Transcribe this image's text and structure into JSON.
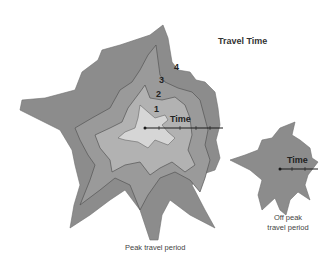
{
  "title": "Travel Time",
  "peak": {
    "caption": "Peak travel period",
    "contours": [
      {
        "label": "4",
        "fill": "#8c8c8c"
      },
      {
        "label": "3",
        "fill": "#9a9a9a"
      },
      {
        "label": "2",
        "fill": "#b2b2b2"
      },
      {
        "label": "1",
        "fill": "#d6d6d6"
      }
    ],
    "axis_label": "Time"
  },
  "offpeak": {
    "caption_line1": "Off peak",
    "caption_line2": "travel period",
    "fill": "#8c8c8c",
    "axis_label": "Time"
  },
  "colors": {
    "background": "#ffffff",
    "outline": "#5a5a5a",
    "axis": "#1a1a1a"
  }
}
